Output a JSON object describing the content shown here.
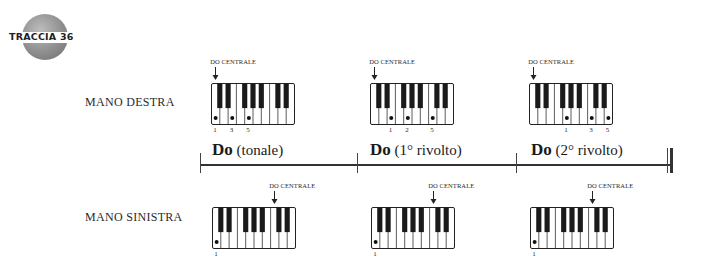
{
  "badge": {
    "text": "TRACCIA 36",
    "color": "#8e8e8e"
  },
  "hands": {
    "right": {
      "label": "MANO DESTRA"
    },
    "left": {
      "label": "MANO SINISTRA"
    }
  },
  "marker_text": "DO CENTRALE",
  "chords": [
    {
      "name": "Do",
      "qualifier": "(tonale)",
      "right_hand": {
        "dots_white_key_index": [
          0,
          2,
          4
        ],
        "fingers": [
          "1",
          "3",
          "5"
        ],
        "middle_c_key_index": 0
      },
      "left_hand": {
        "dots_white_key_index": [
          0
        ],
        "fingers": [
          "1"
        ],
        "middle_c_key_index": 7
      }
    },
    {
      "name": "Do",
      "qualifier": "(1° rivolto)",
      "right_hand": {
        "dots_white_key_index": [
          2,
          4,
          7
        ],
        "fingers": [
          "1",
          "2",
          "5"
        ],
        "middle_c_key_index": 0
      },
      "left_hand": {
        "dots_white_key_index": [
          0
        ],
        "fingers": [
          "1"
        ],
        "middle_c_key_index": 7
      }
    },
    {
      "name": "Do",
      "qualifier": "(2° rivolto)",
      "right_hand": {
        "dots_white_key_index": [
          4,
          7,
          9
        ],
        "fingers": [
          "1",
          "3",
          "5"
        ],
        "middle_c_key_index": 0
      },
      "left_hand": {
        "dots_white_key_index": [
          0
        ],
        "fingers": [
          "1"
        ],
        "middle_c_key_index": 7
      }
    }
  ]
}
